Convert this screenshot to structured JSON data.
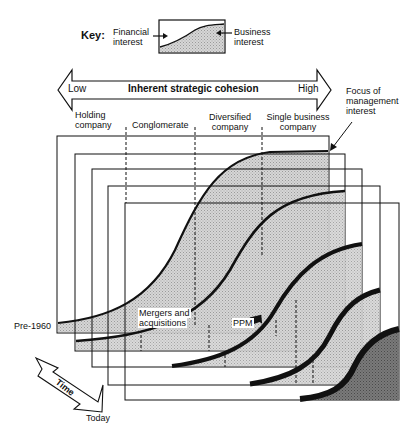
{
  "key": {
    "title": "Key:",
    "left_label_line1": "Financial",
    "left_label_line2": "interest",
    "right_label_line1": "Business",
    "right_label_line2": "interest"
  },
  "axis": {
    "title": "Inherent strategic cohesion",
    "low": "Low",
    "high": "High"
  },
  "focus_label": {
    "line1": "Focus of",
    "line2": "management",
    "line3": "interest"
  },
  "stages": [
    {
      "line1": "Holding",
      "line2": "company"
    },
    {
      "line1": "Conglomerate",
      "line2": ""
    },
    {
      "line1": "Diversified",
      "line2": "company"
    },
    {
      "line1": "Single business",
      "line2": "company"
    }
  ],
  "annotations": {
    "mergers_line1": "Mergers and",
    "mergers_line2": "acquisitions",
    "ppm": "PPM"
  },
  "time": {
    "label": "Time",
    "start": "Pre-1960",
    "end": "Today"
  },
  "colors": {
    "line": "#111111",
    "shade_light": "#c9c9c9",
    "shade_dark": "#6e6e6e",
    "background": "#ffffff"
  }
}
